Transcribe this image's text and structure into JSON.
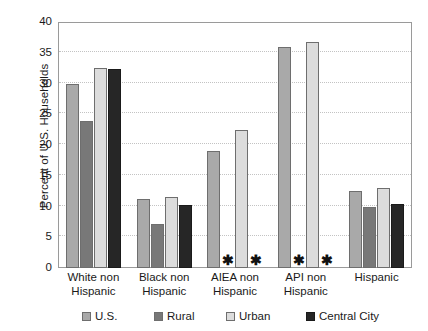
{
  "chart_data": {
    "type": "bar",
    "title": "",
    "xlabel": "",
    "ylabel": "Percent of U.S. Households",
    "ylim": [
      0,
      40
    ],
    "ytick_values": [
      0,
      5,
      10,
      15,
      20,
      25,
      30,
      35,
      40
    ],
    "ytick_labels": [
      "0",
      "5",
      "10",
      "15",
      "20",
      "25",
      "30",
      "35",
      "40"
    ],
    "grid": true,
    "legend_position": "bottom",
    "categories": [
      "White non Hispanic",
      "Black non Hispanic",
      "AIEA non Hispanic",
      "API non Hispanic",
      "Hispanic"
    ],
    "category_lines": [
      [
        "White non",
        "Hispanic"
      ],
      [
        "Black non",
        "Hispanic"
      ],
      [
        "AIEA non",
        "Hispanic"
      ],
      [
        "API non",
        "Hispanic"
      ],
      [
        "Hispanic",
        ""
      ]
    ],
    "series": [
      {
        "name": "U.S.",
        "color": "#a9a9a9",
        "values": [
          30.0,
          11.2,
          19.0,
          36.0,
          12.5
        ]
      },
      {
        "name": "Rural",
        "color": "#787878",
        "values": [
          23.9,
          7.1,
          null,
          null,
          10.0
        ]
      },
      {
        "name": "Urban",
        "color": "#dcdcdc",
        "values": [
          32.5,
          11.5,
          22.4,
          36.7,
          13.0
        ]
      },
      {
        "name": "Central City",
        "color": "#262626",
        "values": [
          32.4,
          10.3,
          null,
          null,
          10.4
        ]
      }
    ],
    "missing_marker": "★",
    "missing_marker_note": "asterisk denotes suppressed/unavailable value"
  },
  "legend": {
    "items": [
      {
        "label": "U.S.",
        "color": "#a9a9a9"
      },
      {
        "label": "Rural",
        "color": "#787878"
      },
      {
        "label": "Urban",
        "color": "#dcdcdc"
      },
      {
        "label": "Central City",
        "color": "#262626"
      }
    ]
  }
}
